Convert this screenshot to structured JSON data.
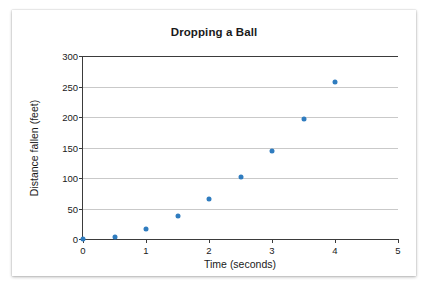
{
  "chart_data": {
    "type": "scatter",
    "title": "Dropping a Ball",
    "xlabel": "Time (seconds)",
    "ylabel": "Distance fallen (feet)",
    "xlim": [
      0,
      5
    ],
    "ylim": [
      0,
      300
    ],
    "xticks": [
      0,
      1,
      2,
      3,
      4,
      5
    ],
    "xtick_labels": [
      "0",
      "1",
      "2",
      "3",
      "4",
      "5"
    ],
    "yticks": [
      0,
      50,
      100,
      150,
      200,
      250,
      300
    ],
    "ytick_labels": [
      "0",
      "50",
      "100",
      "150",
      "200",
      "250",
      "300"
    ],
    "grid": "horizontal",
    "legend": "none",
    "point_color": "#2f7cbf",
    "axis_color": "#3b3b3b",
    "gridline_color": "#c9c9c9",
    "x": [
      0,
      0.5,
      1,
      1.5,
      2,
      2.5,
      3,
      3.5,
      4
    ],
    "y": [
      0,
      4,
      17,
      37,
      65,
      101,
      145,
      197,
      258
    ],
    "points": [
      {
        "x": 0,
        "y": 0
      },
      {
        "x": 0.5,
        "y": 4
      },
      {
        "x": 1,
        "y": 17
      },
      {
        "x": 1.5,
        "y": 37
      },
      {
        "x": 2,
        "y": 65
      },
      {
        "x": 2.5,
        "y": 101
      },
      {
        "x": 3,
        "y": 145
      },
      {
        "x": 3.5,
        "y": 197
      },
      {
        "x": 4,
        "y": 258
      }
    ]
  }
}
